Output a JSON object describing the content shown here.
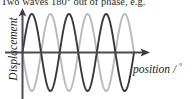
{
  "figure": {
    "caption": "Two waves 180° out of phase, e.g.",
    "axes": {
      "ylabel": "Displacement",
      "xlabel_text": "position / ",
      "xlabel_unit": "°"
    },
    "colors": {
      "background": "#ffffff",
      "axis": "#4a4a50",
      "caption_text": "#2b2b2b",
      "label_text": "#1c1c1c",
      "wave_a": "#3a3a3e",
      "wave_b": "#b9b9bd"
    }
  },
  "chart_data": {
    "type": "line",
    "title": "Two waves 180° out of phase, e.g.",
    "xlabel": "position / °",
    "ylabel": "Displacement",
    "grid": false,
    "legend": "none",
    "xlim": [
      0,
      1080
    ],
    "ylim": [
      -1,
      1
    ],
    "x_tick_labels": [],
    "y_tick_labels": [],
    "cycles": 3,
    "phase_difference_degrees": 180,
    "series": [
      {
        "name": "wave-a",
        "color": "#3a3a3e",
        "amplitude": 1,
        "wavelength_degrees": 360,
        "phase_degrees": 0,
        "function": "sin",
        "x": [
          0,
          45,
          90,
          135,
          180,
          225,
          270,
          315,
          360,
          405,
          450,
          495,
          540,
          585,
          630,
          675,
          720,
          765,
          810,
          855,
          900,
          945,
          990,
          1035,
          1080
        ],
        "y": [
          0,
          0.71,
          1,
          0.71,
          0,
          -0.71,
          -1,
          -0.71,
          0,
          0.71,
          1,
          0.71,
          0,
          -0.71,
          -1,
          -0.71,
          0,
          0.71,
          1,
          0.71,
          0,
          -0.71,
          -1,
          -0.71,
          0
        ]
      },
      {
        "name": "wave-b",
        "color": "#b9b9bd",
        "amplitude": 1,
        "wavelength_degrees": 360,
        "phase_degrees": 180,
        "function": "sin",
        "x": [
          0,
          45,
          90,
          135,
          180,
          225,
          270,
          315,
          360,
          405,
          450,
          495,
          540,
          585,
          630,
          675,
          720,
          765,
          810,
          855,
          900,
          945,
          990,
          1035,
          1080
        ],
        "y": [
          0,
          -0.71,
          -1,
          -0.71,
          0,
          0.71,
          1,
          0.71,
          0,
          -0.71,
          -1,
          -0.71,
          0,
          0.71,
          1,
          0.71,
          0,
          -0.71,
          -1,
          -0.71,
          0,
          0.71,
          1,
          0.71,
          0
        ]
      }
    ]
  }
}
